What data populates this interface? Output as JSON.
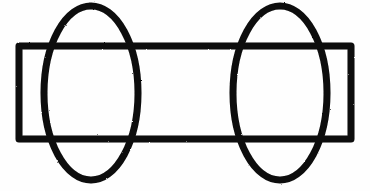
{
  "figure": {
    "background_color": "#fefefe",
    "stroke_color": "#0d0d0d",
    "stroke_width": 7,
    "canvas": {
      "width": 370,
      "height": 191
    },
    "shapes": [
      {
        "id": "rectangle",
        "name": "rectangle",
        "type": "rect",
        "x": 19,
        "y": 46,
        "width": 332,
        "height": 93,
        "stroke_color": "#0d0d0d",
        "stroke_width": 7
      },
      {
        "id": "left-ellipse",
        "name": "left-ellipse",
        "type": "ellipse",
        "cx": 91,
        "cy": 93,
        "rx": 47,
        "ry": 87,
        "stroke_color": "#0d0d0d",
        "stroke_width": 7
      },
      {
        "id": "right-ellipse",
        "name": "right-ellipse",
        "type": "ellipse",
        "cx": 280,
        "cy": 93,
        "rx": 47,
        "ry": 87,
        "stroke_color": "#0d0d0d",
        "stroke_width": 7
      }
    ],
    "labels": []
  }
}
